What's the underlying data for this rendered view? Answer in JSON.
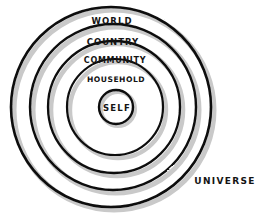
{
  "diagram": {
    "type": "concentric-circles",
    "background_color": "#ffffff",
    "stroke_color": "#111111",
    "shadow_color": "#bdbdbd",
    "text_color": "#141414",
    "rings": [
      {
        "id": "world",
        "label": "WORLD",
        "level": 1,
        "cx": 111,
        "cy": 107,
        "r": 100,
        "stroke_width": 2.6,
        "label_x": 112,
        "label_y": 21
      },
      {
        "id": "country",
        "label": "COUNTRY",
        "level": 2,
        "cx": 113,
        "cy": 107,
        "r": 83,
        "stroke_width": 2.4,
        "label_x": 113,
        "label_y": 42
      },
      {
        "id": "community",
        "label": "COMMUNITY",
        "level": 3,
        "cx": 114,
        "cy": 107,
        "r": 66,
        "stroke_width": 2.3,
        "label_x": 115,
        "label_y": 61
      },
      {
        "id": "household",
        "label": "HOUSEHOLD",
        "level": 4,
        "cx": 115,
        "cy": 107,
        "r": 48,
        "stroke_width": 2.2,
        "label_x": 116,
        "label_y": 80
      },
      {
        "id": "self",
        "label": "SELF",
        "level": 5,
        "cx": 116,
        "cy": 107,
        "r": 17,
        "stroke_width": 2.4,
        "label_x": 117,
        "label_y": 108
      }
    ],
    "outside_label": {
      "id": "universe",
      "label": "UNIVERSE",
      "x": 225,
      "y": 181
    }
  }
}
